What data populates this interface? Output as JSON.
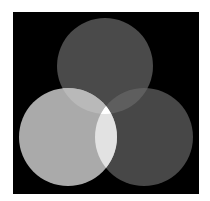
{
  "diagram": {
    "type": "venn",
    "canvas": {
      "width": 210,
      "height": 201,
      "page_bg": "#ffffff"
    },
    "frame": {
      "x": 13,
      "y": 12,
      "width": 186,
      "height": 182,
      "fill": "#000000"
    },
    "circles": [
      {
        "id": "top",
        "cx": 105,
        "cy": 66,
        "r": 48,
        "fill": "#4a4a4a"
      },
      {
        "id": "left",
        "cx": 68,
        "cy": 137,
        "r": 49,
        "fill": "#aaaaaa"
      },
      {
        "id": "right",
        "cx": 144,
        "cy": 137,
        "r": 49,
        "fill": "#474747"
      }
    ],
    "overlaps": {
      "top_left": "#b9b9b9",
      "top_right": "#5e5e5e",
      "left_right": "#e2e2e2",
      "all": "#ffffff"
    }
  }
}
